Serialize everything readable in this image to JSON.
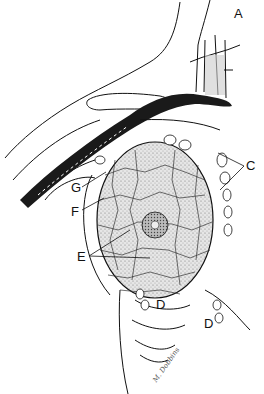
{
  "figure": {
    "labels": [
      {
        "id": "A",
        "text": "A",
        "x": 234,
        "y": 7
      },
      {
        "id": "B",
        "text": "B",
        "x": 178,
        "y": 72
      },
      {
        "id": "C",
        "text": "C",
        "x": 246,
        "y": 159
      },
      {
        "id": "G",
        "text": "G",
        "x": 71,
        "y": 181
      },
      {
        "id": "F",
        "text": "F",
        "x": 71,
        "y": 205
      },
      {
        "id": "E",
        "text": "E",
        "x": 77,
        "y": 250
      },
      {
        "id": "D1",
        "text": "D",
        "x": 156,
        "y": 298
      },
      {
        "id": "D2",
        "text": "D",
        "x": 204,
        "y": 317
      }
    ],
    "signature": "M. Dobbins"
  },
  "colors": {
    "ink": "#111111",
    "vessel": "#1a1a1a",
    "tissue_fill": "#d8d8d8",
    "background": "#ffffff"
  }
}
